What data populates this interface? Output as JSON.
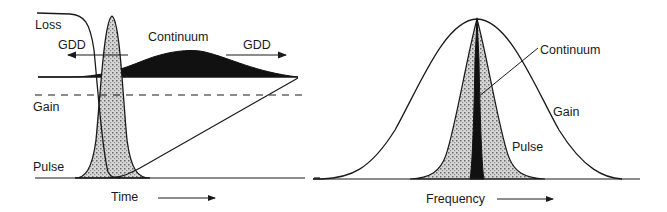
{
  "left_panel": {
    "labels": {
      "loss": "Loss",
      "gdd_left": "GDD",
      "continuum": "Continuum",
      "gdd_right": "GDD",
      "gain": "Gain",
      "pulse": "Pulse",
      "time_axis": "Time"
    }
  },
  "right_panel": {
    "labels": {
      "continuum": "Continuum",
      "gain": "Gain",
      "pulse": "Pulse",
      "frequency_axis": "Frequency"
    }
  },
  "colors": {
    "ink": "#1a1a1a",
    "pulse_fill": "#b5b5b5",
    "continuum_fill": "#111111"
  }
}
